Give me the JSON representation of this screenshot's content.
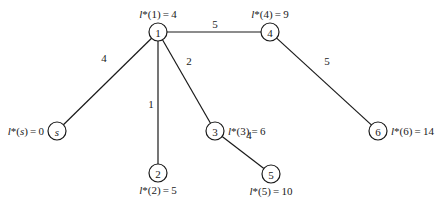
{
  "diagram": {
    "type": "shortest-path-tree",
    "nodes": [
      {
        "id": "s",
        "label": "s",
        "italic": true,
        "x": 57,
        "y": 131,
        "dist_label": "l*(s)=0",
        "dist_value": 0,
        "label_pos": "left"
      },
      {
        "id": "1",
        "label": "1",
        "italic": false,
        "x": 158,
        "y": 32,
        "dist_label": "l*(1)=4",
        "dist_value": 4,
        "label_pos": "top"
      },
      {
        "id": "2",
        "label": "2",
        "italic": false,
        "x": 158,
        "y": 173,
        "dist_label": "l*(2)=5",
        "dist_value": 5,
        "label_pos": "bottom"
      },
      {
        "id": "3",
        "label": "3",
        "italic": false,
        "x": 215,
        "y": 131,
        "dist_label": "l*(3)=6",
        "dist_value": 6,
        "label_pos": "right"
      },
      {
        "id": "4",
        "label": "4",
        "italic": false,
        "x": 270,
        "y": 32,
        "dist_label": "l*(4)=9",
        "dist_value": 9,
        "label_pos": "top"
      },
      {
        "id": "5",
        "label": "5",
        "italic": false,
        "x": 271,
        "y": 174,
        "dist_label": "l*(5)=10",
        "dist_value": 10,
        "label_pos": "bottom"
      },
      {
        "id": "6",
        "label": "6",
        "italic": false,
        "x": 378,
        "y": 131,
        "dist_label": "l*(6)=14",
        "dist_value": 14,
        "label_pos": "right"
      }
    ],
    "edges": [
      {
        "from": "s",
        "to": "1",
        "weight": "4",
        "label_x": 104,
        "label_y": 58
      },
      {
        "from": "1",
        "to": "4",
        "weight": "5",
        "label_x": 215,
        "label_y": 24
      },
      {
        "from": "1",
        "to": "2",
        "weight": "1",
        "label_x": 151,
        "label_y": 104
      },
      {
        "from": "1",
        "to": "3",
        "weight": "2",
        "label_x": 189,
        "label_y": 61
      },
      {
        "from": "4",
        "to": "6",
        "weight": "5",
        "label_x": 327,
        "label_y": 61
      },
      {
        "from": "3",
        "to": "5",
        "weight": "4",
        "label_x": 249,
        "label_y": 135
      }
    ]
  }
}
